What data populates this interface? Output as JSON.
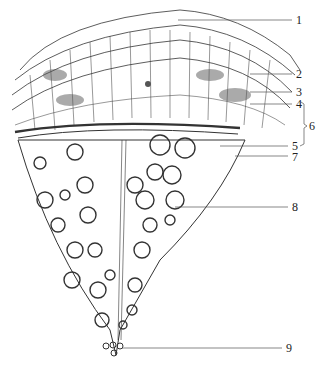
{
  "diagram": {
    "type": "botanical-cross-section",
    "labels": [
      {
        "id": "1",
        "text": "1",
        "x": 296,
        "y": 13,
        "line_from": [
          178,
          20
        ]
      },
      {
        "id": "2",
        "text": "2",
        "x": 296,
        "y": 68,
        "line_from": [
          250,
          74
        ]
      },
      {
        "id": "3",
        "text": "3",
        "x": 296,
        "y": 86,
        "line_from": [
          250,
          92
        ]
      },
      {
        "id": "4",
        "text": "4",
        "x": 296,
        "y": 98,
        "line_from": [
          250,
          104
        ]
      },
      {
        "id": "5",
        "text": "5",
        "x": 292,
        "y": 141,
        "line_from": [
          220,
          146
        ]
      },
      {
        "id": "6",
        "text": "6",
        "x": 308,
        "y": 120
      },
      {
        "id": "7",
        "text": "7",
        "x": 292,
        "y": 151,
        "line_from": [
          235,
          156
        ]
      },
      {
        "id": "8",
        "text": "8",
        "x": 292,
        "y": 201,
        "line_from": [
          175,
          207
        ]
      },
      {
        "id": "9",
        "text": "9",
        "x": 286,
        "y": 343,
        "line_from": [
          140,
          348
        ]
      }
    ],
    "bracket": {
      "label": "6",
      "spans": [
        "4",
        "5"
      ]
    },
    "colors": {
      "ink": "#222222",
      "background": "#ffffff"
    }
  }
}
